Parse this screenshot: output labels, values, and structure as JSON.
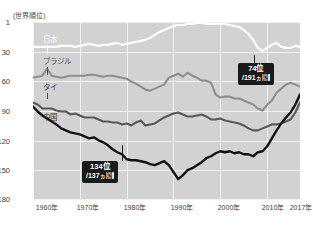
{
  "axis_caption": "(世界順位)",
  "y_ticks": [
    "1",
    "30",
    "60",
    "90",
    "120",
    "150",
    "180"
  ],
  "x_ticks": [
    "1960年",
    "1970年",
    "1980年",
    "1990年",
    "2000年",
    "2010年",
    "2017年"
  ],
  "series_labels": {
    "japan": "日本",
    "brazil": "ブラジル",
    "thailand": "タイ",
    "china": "中国"
  },
  "badges": {
    "china_end": {
      "line1": "74位",
      "line2_pre": "/191",
      "line2_small": "ヵ",
      "line2_boxed": "国"
    },
    "china_mid": {
      "line1": "134位",
      "line2_pre": "/137",
      "line2_small": "ヵ",
      "line2_boxed": "国"
    }
  },
  "chart_data": {
    "type": "line",
    "title": "",
    "subtitle": "",
    "xlabel": "",
    "ylabel": "(世界順位)",
    "ylim": [
      1,
      180
    ],
    "y_inverted": true,
    "xlim": [
      1960,
      2017
    ],
    "grid": true,
    "legend_position": "in-plot-labels",
    "y_tick_values": [
      1,
      30,
      60,
      90,
      120,
      150,
      180
    ],
    "x_tick_values": [
      1960,
      1970,
      1980,
      1990,
      2000,
      2010,
      2017
    ],
    "annotations": [
      {
        "text": "74位 /191ヵ国",
        "series": "中国",
        "x": 2017,
        "y": 74
      },
      {
        "text": "134位 /137ヵ国",
        "series": "中国",
        "x": 1979,
        "y": 134
      }
    ],
    "x": [
      1960,
      1961,
      1962,
      1963,
      1964,
      1965,
      1966,
      1967,
      1968,
      1969,
      1970,
      1971,
      1972,
      1973,
      1974,
      1975,
      1976,
      1977,
      1978,
      1979,
      1980,
      1981,
      1982,
      1983,
      1984,
      1985,
      1986,
      1987,
      1988,
      1989,
      1990,
      1991,
      1992,
      1993,
      1994,
      1995,
      1996,
      1997,
      1998,
      1999,
      2000,
      2001,
      2002,
      2003,
      2004,
      2005,
      2006,
      2007,
      2008,
      2009,
      2010,
      2011,
      2012,
      2013,
      2014,
      2015,
      2016,
      2017
    ],
    "series": [
      {
        "name": "日本",
        "color": "#ffffff",
        "values": [
          26,
          26,
          26,
          26,
          26,
          26,
          25,
          25,
          25,
          26,
          25,
          24,
          23,
          24,
          25,
          24,
          24,
          23,
          22,
          24,
          23,
          22,
          21,
          20,
          19,
          17,
          14,
          11,
          9,
          7,
          5,
          4,
          4,
          3,
          3,
          2,
          2,
          3,
          3,
          3,
          3,
          3,
          4,
          5,
          6,
          9,
          13,
          19,
          27,
          30,
          27,
          24,
          22,
          26,
          27,
          27,
          25,
          26
        ]
      },
      {
        "name": "ブラジル",
        "color": "#8e8e8e",
        "values": [
          57,
          56,
          55,
          48,
          55,
          56,
          57,
          56,
          55,
          55,
          55,
          55,
          54,
          54,
          55,
          56,
          55,
          55,
          56,
          57,
          58,
          61,
          63,
          66,
          69,
          70,
          68,
          66,
          64,
          57,
          55,
          53,
          56,
          52,
          55,
          57,
          60,
          60,
          62,
          74,
          77,
          76,
          76,
          78,
          78,
          80,
          82,
          84,
          88,
          90,
          84,
          80,
          72,
          68,
          64,
          62,
          64,
          66
        ]
      },
      {
        "name": "タイ",
        "color": "#585858",
        "values": [
          82,
          84,
          88,
          88,
          88,
          90,
          91,
          91,
          94,
          93,
          95,
          97,
          97,
          97,
          99,
          101,
          101,
          102,
          102,
          104,
          103,
          105,
          102,
          100,
          105,
          104,
          103,
          100,
          97,
          95,
          93,
          92,
          94,
          96,
          96,
          95,
          94,
          96,
          99,
          99,
          98,
          100,
          101,
          102,
          103,
          105,
          108,
          110,
          110,
          108,
          106,
          104,
          104,
          103,
          101,
          99,
          92,
          82
        ]
      },
      {
        "name": "中国",
        "color": "#111111",
        "values": [
          86,
          91,
          95,
          98,
          101,
          104,
          108,
          110,
          112,
          113,
          114,
          116,
          118,
          117,
          120,
          122,
          125,
          129,
          132,
          134,
          139,
          140,
          140,
          141,
          142,
          144,
          145,
          143,
          141,
          145,
          152,
          159,
          155,
          150,
          148,
          145,
          142,
          138,
          136,
          133,
          131,
          132,
          131,
          133,
          132,
          134,
          134,
          136,
          132,
          131,
          126,
          118,
          110,
          103,
          97,
          92,
          84,
          74
        ]
      }
    ]
  }
}
